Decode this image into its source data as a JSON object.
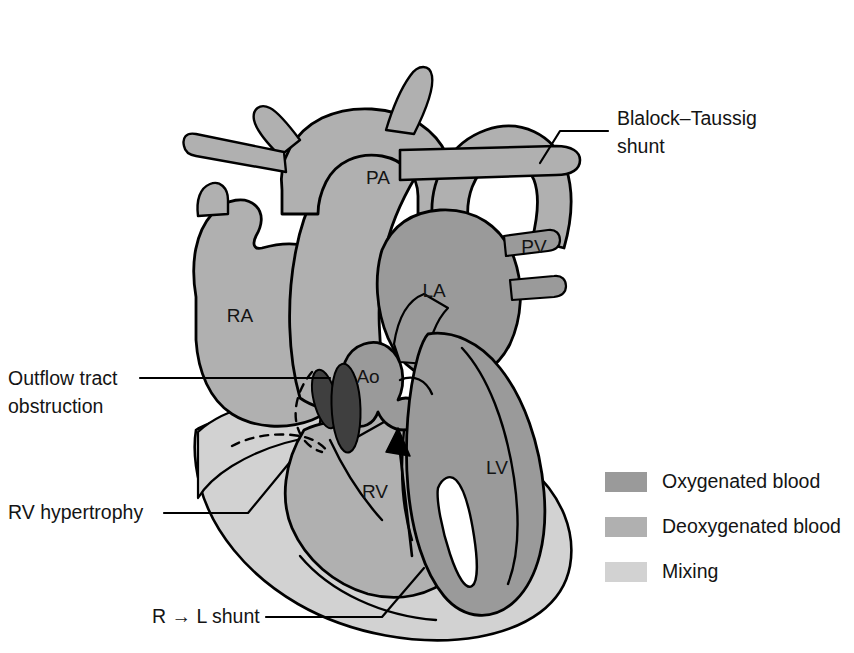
{
  "figure": {
    "background_color": "#ffffff",
    "outline_color": "#000000"
  },
  "colors": {
    "oxygenated": "#9a9a9a",
    "deoxygenated": "#b0b0b0",
    "mixing": "#d2d2d2",
    "valve_dark": "#3f3f3f",
    "text": "#141414",
    "line": "#000000"
  },
  "chamber_labels": [
    {
      "id": "PA",
      "text": "PA",
      "x": 378,
      "y": 184
    },
    {
      "id": "PV",
      "text": "PV",
      "x": 534,
      "y": 253
    },
    {
      "id": "LA",
      "text": "LA",
      "x": 434,
      "y": 297
    },
    {
      "id": "RA",
      "text": "RA",
      "x": 240,
      "y": 322
    },
    {
      "id": "Ao",
      "text": "Ao",
      "x": 368,
      "y": 383
    },
    {
      "id": "LV",
      "text": "LV",
      "x": 497,
      "y": 474
    },
    {
      "id": "RV",
      "text": "RV",
      "x": 375,
      "y": 498
    }
  ],
  "callouts": [
    {
      "id": "blalock-taussig-shunt",
      "lines": [
        "Blalock–Taussig",
        "shunt"
      ],
      "text_x": 617,
      "text_y": 125,
      "line_height": 28
    },
    {
      "id": "outflow-tract-obstruction",
      "lines": [
        "Outflow tract",
        "obstruction"
      ],
      "text_x": 8,
      "text_y": 385,
      "line_height": 28
    },
    {
      "id": "rv-hypertrophy",
      "lines": [
        "RV hypertrophy"
      ],
      "text_x": 8,
      "text_y": 519,
      "line_height": 28
    },
    {
      "id": "r-to-l-shunt",
      "lines": [
        "R → L shunt"
      ],
      "text_x": 152,
      "text_y": 623,
      "line_height": 28
    }
  ],
  "legend": {
    "items": [
      {
        "id": "oxygenated",
        "label": "Oxygenated blood",
        "swatch_color": "#9a9a9a",
        "x": 605,
        "y": 472
      },
      {
        "id": "deoxygenated",
        "label": "Deoxygenated blood",
        "swatch_color": "#b0b0b0",
        "x": 605,
        "y": 517
      },
      {
        "id": "mixing",
        "label": "Mixing",
        "swatch_color": "#d2d2d2",
        "x": 605,
        "y": 562
      }
    ],
    "swatch_width": 42,
    "swatch_height": 20,
    "label_offset_x": 57
  }
}
